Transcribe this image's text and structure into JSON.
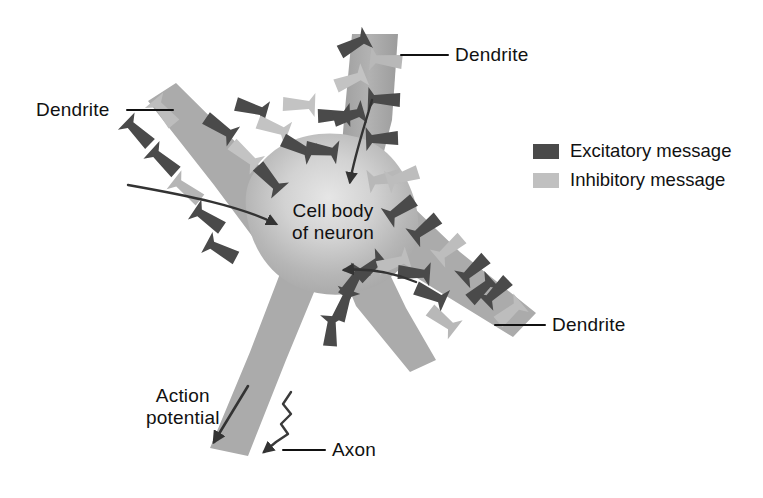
{
  "figure": {
    "background_color": "#ffffff"
  },
  "colors": {
    "excitatory": "#4a4a4a",
    "inhibitory": "#c0c0c0",
    "neuron_body": "#b9b9b9",
    "neuron_highlight": "#e2e2e2",
    "dendrite": "#a8a8a8",
    "axon": "#a8a8a8",
    "text": "#111111",
    "arrow": "#333333",
    "leader_line": "#111111"
  },
  "labels": {
    "dendrite_top": "Dendrite",
    "dendrite_left": "Dendrite",
    "dendrite_right": "Dendrite",
    "cell_body_line1": "Cell body",
    "cell_body_line2": "of neuron",
    "action_potential_line1": "Action",
    "action_potential_line2": "potential",
    "axon": "Axon"
  },
  "legend": {
    "items": [
      {
        "label": "Excitatory message",
        "color": "#4a4a4a",
        "swatch": "excitatory-swatch"
      },
      {
        "label": "Inhibitory message",
        "color": "#c0c0c0",
        "swatch": "inhibitory-swatch"
      }
    ]
  },
  "annotations": {
    "arrows_into_soma": 3,
    "action_potential_arrow": "down-left",
    "axon_impulse": "zigzag-arrow"
  }
}
